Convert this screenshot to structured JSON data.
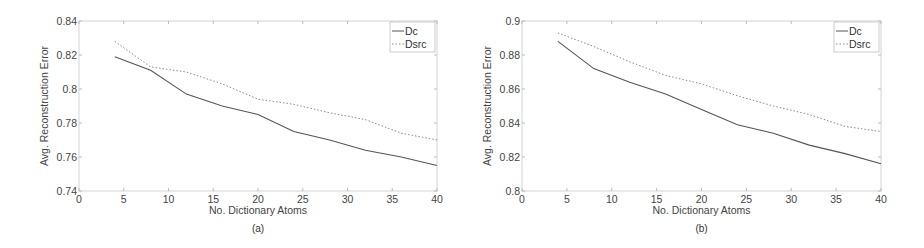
{
  "chart_data": [
    {
      "id": "a",
      "type": "line",
      "caption": "(a)",
      "title": "",
      "xlabel": "No. Dictionary Atoms",
      "ylabel": "Avg. Reconstruction Error",
      "xlim": [
        0,
        40
      ],
      "ylim": [
        0.74,
        0.84
      ],
      "xticks": [
        0,
        5,
        10,
        15,
        20,
        25,
        30,
        35,
        40
      ],
      "yticks": [
        0.74,
        0.76,
        0.78,
        0.8,
        0.82,
        0.84
      ],
      "ytick_labels": [
        "0.74",
        "0.76",
        "0.78",
        "0.8",
        "0.82",
        "0.84"
      ],
      "grid": false,
      "legend_position": "upper right",
      "x": [
        4,
        8,
        12,
        16,
        20,
        24,
        28,
        32,
        36,
        40
      ],
      "series": [
        {
          "name": "Dc",
          "style": "solid",
          "color": "#555555",
          "values": [
            0.819,
            0.811,
            0.797,
            0.79,
            0.785,
            0.775,
            0.77,
            0.764,
            0.76,
            0.755
          ]
        },
        {
          "name": "Dsrc",
          "style": "dotted",
          "color": "#888888",
          "values": [
            0.828,
            0.813,
            0.81,
            0.803,
            0.794,
            0.791,
            0.786,
            0.782,
            0.774,
            0.77
          ]
        }
      ]
    },
    {
      "id": "b",
      "type": "line",
      "caption": "(b)",
      "title": "",
      "xlabel": "No. Dictionary Atoms",
      "ylabel": "Avg. Reconstruction Error",
      "xlim": [
        0,
        40
      ],
      "ylim": [
        0.8,
        0.9
      ],
      "xticks": [
        0,
        5,
        10,
        15,
        20,
        25,
        30,
        35,
        40
      ],
      "yticks": [
        0.8,
        0.82,
        0.84,
        0.86,
        0.88,
        0.9
      ],
      "ytick_labels": [
        "0.8",
        "0.82",
        "0.84",
        "0.86",
        "0.88",
        "0.9"
      ],
      "grid": false,
      "legend_position": "upper right",
      "x": [
        4,
        8,
        12,
        16,
        20,
        24,
        28,
        32,
        36,
        40
      ],
      "series": [
        {
          "name": "Dc",
          "style": "solid",
          "color": "#555555",
          "values": [
            0.888,
            0.872,
            0.864,
            0.857,
            0.848,
            0.839,
            0.834,
            0.827,
            0.822,
            0.816
          ]
        },
        {
          "name": "Dsrc",
          "style": "dotted",
          "color": "#888888",
          "values": [
            0.893,
            0.885,
            0.876,
            0.868,
            0.863,
            0.856,
            0.85,
            0.845,
            0.838,
            0.835
          ]
        }
      ]
    }
  ]
}
